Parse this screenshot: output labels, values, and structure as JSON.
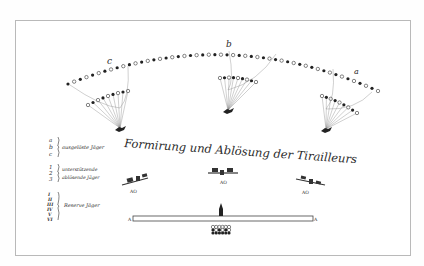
{
  "plate": {
    "title": "Formirung und Ablösung der Tirailleurs",
    "frame_color": "#b9b9b9",
    "ink_color": "#2a2a2a",
    "background": "#ffffff"
  },
  "skirmish_line": {
    "labels": [
      "c",
      "b",
      "a"
    ],
    "post_labels": [
      "m",
      "m",
      "m"
    ]
  },
  "supports": {
    "label": "AO",
    "count": 3
  },
  "reserve": {
    "line_end_left": "A",
    "line_end_right": "A"
  },
  "legend": {
    "groups": [
      {
        "keys": [
          "a",
          "b",
          "c"
        ],
        "text": "ausgelöste Jäger"
      },
      {
        "keys": [
          "1",
          "2",
          "3"
        ],
        "text_line1": "unterstützende",
        "text_line2": "ablösende Jäger"
      },
      {
        "keys": [
          "I",
          "II",
          "III",
          "IV",
          "V",
          "VI"
        ],
        "text": "Reserve Jäger"
      }
    ]
  }
}
